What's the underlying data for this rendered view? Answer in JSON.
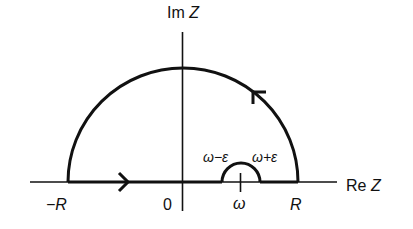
{
  "diagram": {
    "axes": {
      "imaginary_label_prefix": "Im",
      "imaginary_label_var": "Z",
      "real_label_prefix": "Re",
      "real_label_var": "Z"
    },
    "tick_labels": {
      "minus_R": "−R",
      "zero": "0",
      "omega": "ω",
      "R": "R"
    },
    "indent_labels": {
      "left": "ω−ε",
      "right": "ω+ε"
    },
    "arrows": {
      "real_axis_direction": "right",
      "arc_direction": "counterclockwise"
    },
    "colors": {
      "stroke": "#111111",
      "background": "#ffffff"
    }
  }
}
